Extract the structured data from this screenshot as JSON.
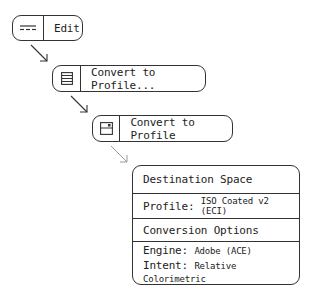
{
  "steps": [
    {
      "label": "Edit",
      "icon": "menu-bar-icon"
    },
    {
      "label": "Convert to Profile...",
      "icon": "menu-list-icon"
    },
    {
      "label": "Convert to Profile",
      "icon": "dialog-window-icon"
    }
  ],
  "panel": {
    "destination_header": "Destination Space",
    "profile_label": "Profile:",
    "profile_value": "ISO Coated v2 (ECI)",
    "options_header": "Conversion Options",
    "engine_label": "Engine:",
    "engine_value": "Adobe (ACE)",
    "intent_label": "Intent:",
    "intent_value": "Relative Colorimetric"
  },
  "colors": {
    "stroke": "#333333",
    "faded_arrow": "#999999"
  }
}
